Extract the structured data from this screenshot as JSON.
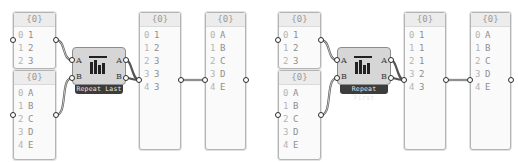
{
  "groups": [
    {
      "component": {
        "name": "Repeat Last",
        "inputs": [
          "A",
          "B"
        ],
        "outputs": [
          "A",
          "B"
        ]
      },
      "input_numbers": {
        "header": "{0}",
        "rows": [
          [
            "0",
            "1"
          ],
          [
            "1",
            "2"
          ],
          [
            "2",
            "3"
          ]
        ]
      },
      "input_letters": {
        "header": "{0}",
        "rows": [
          [
            "0",
            "A"
          ],
          [
            "1",
            "B"
          ],
          [
            "2",
            "C"
          ],
          [
            "3",
            "D"
          ],
          [
            "4",
            "E"
          ]
        ]
      },
      "output_numbers": {
        "header": "{0}",
        "rows": [
          [
            "0",
            "1"
          ],
          [
            "1",
            "2"
          ],
          [
            "2",
            "3"
          ],
          [
            "3",
            "3"
          ],
          [
            "4",
            "3"
          ]
        ]
      },
      "output_letters": {
        "header": "{0}",
        "rows": [
          [
            "0",
            "A"
          ],
          [
            "1",
            "B"
          ],
          [
            "2",
            "C"
          ],
          [
            "3",
            "D"
          ],
          [
            "4",
            "E"
          ]
        ]
      }
    },
    {
      "component": {
        "name": "Repeat First",
        "inputs": [
          "A",
          "B"
        ],
        "outputs": [
          "A",
          "B"
        ]
      },
      "input_numbers": {
        "header": "{0}",
        "rows": [
          [
            "0",
            "1"
          ],
          [
            "1",
            "2"
          ],
          [
            "2",
            "3"
          ]
        ]
      },
      "input_letters": {
        "header": "{0}",
        "rows": [
          [
            "0",
            "A"
          ],
          [
            "1",
            "B"
          ],
          [
            "2",
            "C"
          ],
          [
            "3",
            "D"
          ],
          [
            "4",
            "E"
          ]
        ]
      },
      "output_numbers": {
        "header": "{0}",
        "rows": [
          [
            "0",
            "1"
          ],
          [
            "1",
            "1"
          ],
          [
            "2",
            "1"
          ],
          [
            "3",
            "2"
          ],
          [
            "4",
            "3"
          ]
        ]
      },
      "output_letters": {
        "header": "{0}",
        "rows": [
          [
            "0",
            "A"
          ],
          [
            "1",
            "B"
          ],
          [
            "2",
            "C"
          ],
          [
            "3",
            "D"
          ],
          [
            "4",
            "E"
          ]
        ]
      }
    }
  ],
  "colors": {
    "wire": "#4a4a4a",
    "panel_bg": "#fafafa",
    "component_bg": "#d6d6d6",
    "label_bg": "#3c3c3c"
  }
}
